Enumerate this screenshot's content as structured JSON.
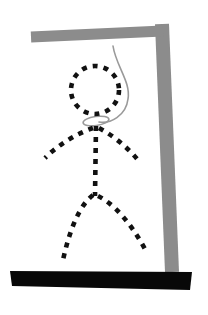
{
  "scene": {
    "title": "Hangman Drawing",
    "description": "Hangman puzzle illustration: gray gallows with a rope and a dashed stick figure hanging from it",
    "background_color": "#ffffff",
    "width": 208,
    "height": 315
  },
  "colors": {
    "gallows_gray": "#8c8c8c",
    "base_black": "#080808",
    "figure_black": "#111111",
    "rope_gray": "#9a9a9a",
    "background": "#ffffff"
  },
  "gallows": {
    "beam": {
      "label": "Crossbeam",
      "x1": 31,
      "y1": 37,
      "x2": 163,
      "y2": 31,
      "thickness": 11
    },
    "post": {
      "label": "Upright Post",
      "x1": 162,
      "y1": 24,
      "x2": 172,
      "y2": 272,
      "thickness": 14
    },
    "base": {
      "label": "Base Platform",
      "x": 10,
      "y": 271,
      "width": 182,
      "height": 19
    }
  },
  "rope": {
    "label": "Rope",
    "path": "M 113 46 C 116 66, 131 82, 128 99 C 126 116, 110 124, 99 122",
    "stroke_width": 1.6,
    "noose_loop": {
      "label": "Noose Loop",
      "cx": 96,
      "cy": 121,
      "rx": 13,
      "ry": 4.5,
      "rotation": -8
    }
  },
  "figure": {
    "label": "Stick Figure",
    "stroke_width": 4.6,
    "dash_pattern": "5 6",
    "parts": [
      {
        "name": "head",
        "label": "Head",
        "type": "circle",
        "cx": 95,
        "cy": 90,
        "r": 24
      },
      {
        "name": "torso",
        "label": "Torso",
        "type": "path",
        "d": "M 96 126 L 95 196"
      },
      {
        "name": "left-arm",
        "label": "Left Arm",
        "type": "path",
        "d": "M 93 128 C 76 134, 58 145, 45 158"
      },
      {
        "name": "right-arm",
        "label": "Right Arm",
        "type": "path",
        "d": "M 99 128 C 114 136, 128 148, 138 160"
      },
      {
        "name": "left-leg",
        "label": "Left Leg",
        "type": "path",
        "d": "M 93 195 C 80 205, 70 228, 63 260"
      },
      {
        "name": "right-leg",
        "label": "Right Leg",
        "type": "path",
        "d": "M 98 196 C 114 204, 130 222, 145 249"
      }
    ]
  }
}
